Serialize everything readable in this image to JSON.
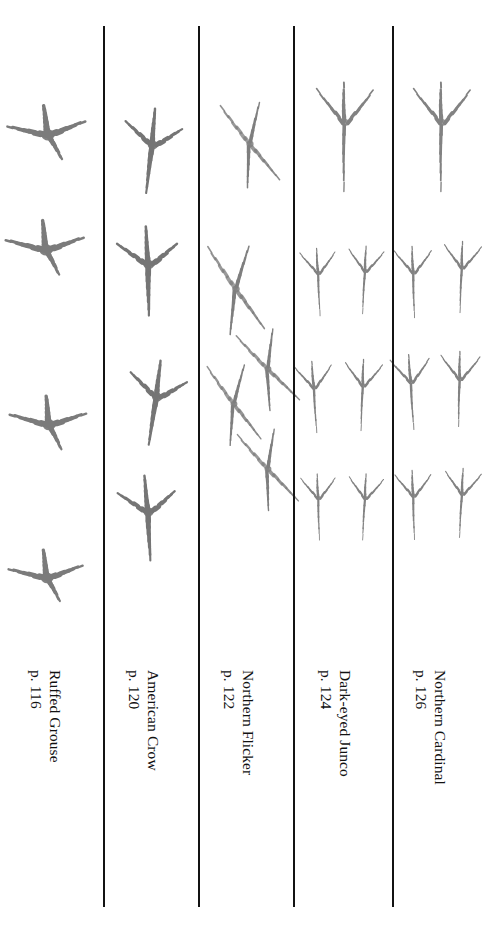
{
  "plate": {
    "background_color": "#ffffff",
    "ink_color": "#5f5f5f",
    "rule_color": "#131313",
    "text_color": "#111111",
    "orientation": "captions rotated 90 degrees clockwise"
  },
  "columns": [
    {
      "id": "ruffed-grouse",
      "species": "Ruffed Grouse",
      "page_ref": "p. 116",
      "track_type": "grouse",
      "track_count": 4,
      "layout": "single file column of four broad tracks",
      "tracks": [
        {
          "x": 48,
          "y": 75,
          "scale": 1.0,
          "rot": -6
        },
        {
          "x": 46,
          "y": 190,
          "scale": 1.0,
          "rot": -4
        },
        {
          "x": 49,
          "y": 365,
          "scale": 0.98,
          "rot": -3
        },
        {
          "x": 47,
          "y": 518,
          "scale": 0.95,
          "rot": -5
        }
      ]
    },
    {
      "id": "american-crow",
      "species": "American Crow",
      "page_ref": "p. 120",
      "track_type": "crow",
      "track_count": 4,
      "layout": "single file column of four slender tracks with long hind toe",
      "tracks": [
        {
          "x": 49,
          "y": 78,
          "scale": 1.0,
          "rot": 6
        },
        {
          "x": 46,
          "y": 198,
          "scale": 1.05,
          "rot": -2
        },
        {
          "x": 53,
          "y": 330,
          "scale": 1.0,
          "rot": 8
        },
        {
          "x": 46,
          "y": 445,
          "scale": 1.0,
          "rot": -4
        }
      ]
    },
    {
      "id": "northern-flicker",
      "species": "Northern Flicker",
      "page_ref": "p. 122",
      "track_type": "flicker",
      "track_count": 5,
      "layout": "staggered trail of five X-shaped zygodactyl tracks",
      "tracks": [
        {
          "x": 52,
          "y": 70,
          "scale": 1.0,
          "rot": 0
        },
        {
          "x": 38,
          "y": 215,
          "scale": 1.05,
          "rot": 4
        },
        {
          "x": 70,
          "y": 295,
          "scale": 0.95,
          "rot": -6
        },
        {
          "x": 36,
          "y": 330,
          "scale": 0.95,
          "rot": 2
        },
        {
          "x": 70,
          "y": 395,
          "scale": 0.95,
          "rot": -4
        }
      ]
    },
    {
      "id": "dark-eyed-junco",
      "species": "Dark-eyed Junco",
      "page_ref": "p. 124",
      "track_type": "passerine",
      "track_count": 7,
      "layout": "one enlarged track above three hopping pairs",
      "tracks": [
        {
          "x": 52,
          "y": 70,
          "scale": 1.45,
          "rot": 0
        },
        {
          "x": 26,
          "y": 215,
          "scale": 0.9,
          "rot": -3
        },
        {
          "x": 72,
          "y": 213,
          "scale": 0.9,
          "rot": 3
        },
        {
          "x": 22,
          "y": 330,
          "scale": 0.95,
          "rot": -4
        },
        {
          "x": 70,
          "y": 328,
          "scale": 0.95,
          "rot": 2
        },
        {
          "x": 26,
          "y": 440,
          "scale": 0.88,
          "rot": -2
        },
        {
          "x": 72,
          "y": 440,
          "scale": 0.88,
          "rot": 3
        }
      ]
    },
    {
      "id": "northern-cardinal",
      "species": "Northern Cardinal",
      "page_ref": "p. 126",
      "track_type": "passerine",
      "track_count": 7,
      "layout": "one enlarged track above three hopping pairs",
      "tracks": [
        {
          "x": 50,
          "y": 70,
          "scale": 1.45,
          "rot": 0
        },
        {
          "x": 22,
          "y": 215,
          "scale": 0.95,
          "rot": -2
        },
        {
          "x": 70,
          "y": 210,
          "scale": 0.95,
          "rot": 2
        },
        {
          "x": 20,
          "y": 325,
          "scale": 1.0,
          "rot": -4
        },
        {
          "x": 68,
          "y": 322,
          "scale": 1.0,
          "rot": 1
        },
        {
          "x": 22,
          "y": 438,
          "scale": 0.92,
          "rot": -2
        },
        {
          "x": 70,
          "y": 436,
          "scale": 0.92,
          "rot": 3
        }
      ]
    }
  ],
  "dividers": [
    {
      "id": "divider-1",
      "x": 103
    },
    {
      "id": "divider-2",
      "x": 198
    },
    {
      "id": "divider-3",
      "x": 293
    },
    {
      "id": "divider-4",
      "x": 392
    }
  ]
}
